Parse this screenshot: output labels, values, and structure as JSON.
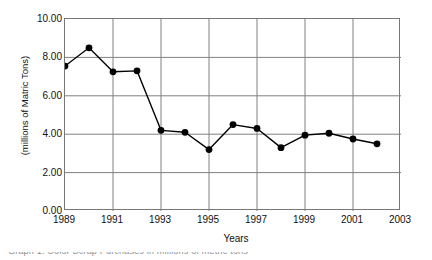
{
  "chart_data": {
    "type": "line",
    "title": "",
    "xlabel": "Years",
    "ylabel": "(millions of Matric Tons)",
    "x": [
      1989,
      1990,
      1991,
      1992,
      1993,
      1994,
      1995,
      1996,
      1997,
      1998,
      1999,
      2000,
      2001,
      2002
    ],
    "values": [
      7.55,
      8.5,
      7.25,
      7.3,
      4.2,
      4.1,
      3.2,
      4.5,
      4.3,
      3.3,
      3.95,
      4.05,
      3.75,
      3.5
    ],
    "xlim": [
      1989,
      2003
    ],
    "ylim": [
      0,
      10
    ],
    "xticks": [
      1989,
      1991,
      1993,
      1995,
      1997,
      1999,
      2001,
      2003
    ],
    "xtick_labels": [
      "1989",
      "1991",
      "1993",
      "1995",
      "1997",
      "1999",
      "2001",
      "2003"
    ],
    "yticks": [
      0,
      2,
      4,
      6,
      8,
      10
    ],
    "ytick_labels": [
      "0.00",
      "2.00",
      "4.00",
      "6.00",
      "8.00",
      "10.00"
    ],
    "grid": true,
    "legend": false,
    "marker": "filled-circle",
    "line_color": "#000000",
    "marker_color": "#000000",
    "grid_color": "#808080",
    "frame_color": "#777777",
    "background": "#ffffff"
  },
  "figure": {
    "caption_clipped": "Graph 1: Color Scrap Purchases in millions of metric tons"
  }
}
